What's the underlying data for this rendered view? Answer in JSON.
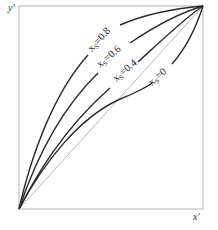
{
  "diagram": {
    "axes": {
      "y_label": "y'",
      "x_label": "x'"
    },
    "diagonal": {
      "name": "y=x reference line"
    },
    "curves": [
      {
        "id": "xs-0.8",
        "label_main": "x",
        "label_sub": "S",
        "label_value": "=0.8",
        "value": 0.8
      },
      {
        "id": "xs-0.6",
        "label_main": "x",
        "label_sub": "S",
        "label_value": "=0.6",
        "value": 0.6
      },
      {
        "id": "xs-0.4",
        "label_main": "x",
        "label_sub": "S",
        "label_value": "=0.4",
        "value": 0.4
      },
      {
        "id": "xs-0",
        "label_main": "x",
        "label_sub": "S",
        "label_value": "=0",
        "value": 0
      }
    ],
    "colors": {
      "frame": "#9a9a9a",
      "curve": "#2a2a2a",
      "diagonal": "#8a8a8a"
    }
  }
}
